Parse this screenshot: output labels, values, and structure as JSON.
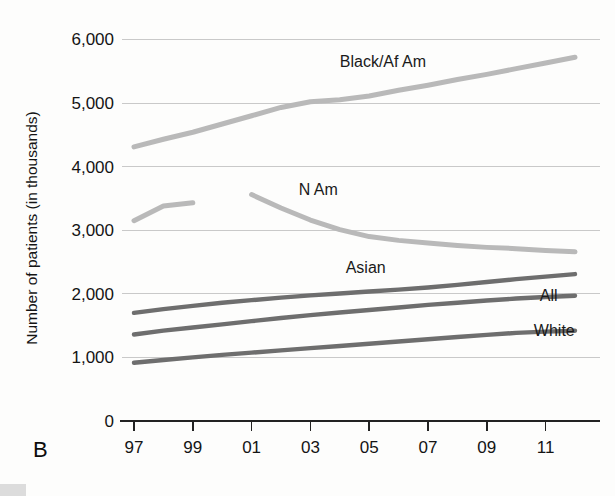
{
  "panel": {
    "letter": "B"
  },
  "chart_data": {
    "type": "line",
    "title": "",
    "xlabel": "",
    "ylabel": "Number of patients (in thousands)",
    "ylim": [
      0,
      6000
    ],
    "xlim": [
      1997,
      2012
    ],
    "grid": true,
    "legend_position": "inline-labels",
    "ytick_labels": [
      "6,000",
      "5,000",
      "4,000",
      "3,000",
      "2,000",
      "1,000",
      "0"
    ],
    "ytick_values": [
      6000,
      5000,
      4000,
      3000,
      2000,
      1000,
      0
    ],
    "xtick_labels": [
      "97",
      "99",
      "01",
      "03",
      "05",
      "07",
      "09",
      "11"
    ],
    "xtick_values": [
      1997,
      1999,
      2001,
      2003,
      2005,
      2007,
      2009,
      2011
    ],
    "colors": {
      "light_series": "#b9b9b9",
      "dark_series": "#6e6e6e",
      "gridline": "#c9c9c9",
      "axis": "#222222",
      "text": "#141414"
    },
    "series": [
      {
        "name": "Black/Af Am",
        "color": "#b9b9b9",
        "label_x": 2004.0,
        "label_y": 5560,
        "x": [
          1997,
          1998,
          1999,
          2000,
          2001,
          2002,
          2003,
          2004,
          2005,
          2006,
          2007,
          2008,
          2009,
          2010,
          2011,
          2012
        ],
        "values": [
          4310,
          4430,
          4540,
          4670,
          4800,
          4930,
          5020,
          5050,
          5110,
          5200,
          5280,
          5370,
          5450,
          5540,
          5630,
          5720
        ]
      },
      {
        "name": "N Am",
        "color": "#b9b9b9",
        "label_x": 2002.6,
        "label_y": 3560,
        "segments": [
          {
            "x": [
              1997,
              1998,
              1999
            ],
            "values": [
              3150,
              3380,
              3430
            ]
          },
          {
            "x": [
              2001,
              2002,
              2003,
              2004,
              2005,
              2006,
              2007,
              2008,
              2009,
              2010,
              2011,
              2012
            ],
            "values": [
              3560,
              3350,
              3160,
              3010,
              2900,
              2840,
              2800,
              2760,
              2730,
              2710,
              2680,
              2660
            ]
          }
        ]
      },
      {
        "name": "Asian",
        "color": "#6e6e6e",
        "label_x": 2004.2,
        "label_y": 2330,
        "x": [
          1997,
          1998,
          1999,
          2000,
          2001,
          2002,
          2003,
          2004,
          2005,
          2006,
          2007,
          2008,
          2009,
          2010,
          2011,
          2012
        ],
        "values": [
          1700,
          1760,
          1810,
          1860,
          1900,
          1940,
          1975,
          2005,
          2035,
          2065,
          2100,
          2140,
          2185,
          2230,
          2270,
          2310
        ]
      },
      {
        "name": "All",
        "color": "#6e6e6e",
        "label_x": 2010.8,
        "label_y": 1880,
        "x": [
          1997,
          1998,
          1999,
          2000,
          2001,
          2002,
          2003,
          2004,
          2005,
          2006,
          2007,
          2008,
          2009,
          2010,
          2011,
          2012
        ],
        "values": [
          1360,
          1420,
          1470,
          1520,
          1570,
          1620,
          1665,
          1705,
          1745,
          1785,
          1825,
          1860,
          1895,
          1925,
          1950,
          1970
        ]
      },
      {
        "name": "White",
        "color": "#6e6e6e",
        "label_x": 2010.6,
        "label_y": 1330,
        "x": [
          1997,
          1998,
          1999,
          2000,
          2001,
          2002,
          2003,
          2004,
          2005,
          2006,
          2007,
          2008,
          2009,
          2010,
          2011,
          2012
        ],
        "values": [
          915,
          960,
          1000,
          1040,
          1075,
          1110,
          1145,
          1180,
          1215,
          1250,
          1285,
          1320,
          1355,
          1385,
          1405,
          1420
        ]
      }
    ]
  }
}
